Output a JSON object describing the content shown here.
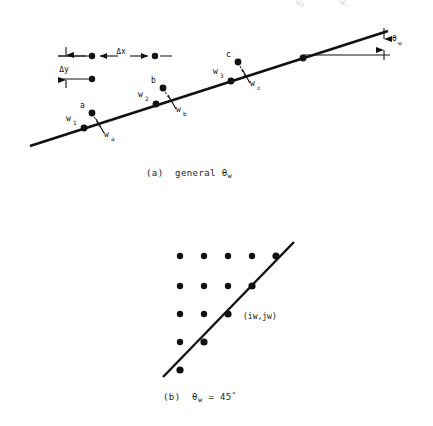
{
  "figure": {
    "background_color": "#ffffff",
    "ink_color": "#111111",
    "ghost_color": "#d8d8d8",
    "ghost_labels": [
      {
        "base": "w",
        "sub": "b"
      },
      {
        "base": "w",
        "sub": "c"
      }
    ],
    "panels": [
      {
        "id": "panel-a",
        "caption_prefix": "(a)",
        "caption_word": "general",
        "caption_symbol": "θ",
        "caption_symbol_sub": "w",
        "angle_label": {
          "base": "θ",
          "sub": "w"
        },
        "delta_x_label": "Δx",
        "delta_y_label": "Δy",
        "wall_line": {
          "x1": 30,
          "y1": 146,
          "x2": 388,
          "y2": 31
        },
        "horizontal_ref": {
          "x1": 303,
          "y1": 55,
          "x2": 390,
          "y2": 55
        },
        "wall_nodes": [
          {
            "name": "w1",
            "label_base": "w",
            "label_sub": "1",
            "x": 84,
            "y": 128,
            "label_x": 70,
            "label_y": 118
          },
          {
            "name": "w2",
            "label_base": "w",
            "label_sub": "2",
            "x": 156,
            "y": 104,
            "label_x": 141,
            "label_y": 94
          },
          {
            "name": "w3",
            "label_base": "w",
            "label_sub": "3",
            "x": 231,
            "y": 81,
            "label_x": 216,
            "label_y": 70
          },
          {
            "name": "w4",
            "label_base": "",
            "label_sub": "",
            "x": 303,
            "y": 58,
            "label_x": 0,
            "label_y": 0
          }
        ],
        "data_points": [
          {
            "name": "a",
            "label": "a",
            "x": 92,
            "y": 113,
            "label_x": 83,
            "label_y": 103,
            "foot_x": 100,
            "foot_y": 126,
            "foot_label_base": "w",
            "foot_label_sub": "a",
            "foot_label_x": 102,
            "foot_label_y": 130
          },
          {
            "name": "b",
            "label": "b",
            "x": 163,
            "y": 88,
            "label_x": 153,
            "label_y": 79,
            "foot_x": 172,
            "foot_y": 101,
            "foot_label_base": "w",
            "foot_label_sub": "b",
            "foot_label_x": 174,
            "foot_label_y": 105
          },
          {
            "name": "c",
            "label": "c",
            "x": 238,
            "y": 62,
            "label_x": 229,
            "label_y": 52,
            "foot_x": 246,
            "foot_y": 78,
            "foot_label_base": "w",
            "foot_label_sub": "c",
            "foot_label_x": 248,
            "foot_label_y": 82
          }
        ],
        "dimension_dots": [
          {
            "x": 92,
            "y": 56
          },
          {
            "x": 155,
            "y": 56
          },
          {
            "x": 92,
            "y": 79
          }
        ]
      },
      {
        "id": "panel-b",
        "caption_prefix": "(b)",
        "caption_symbol": "θ",
        "caption_symbol_sub": "w",
        "caption_equals": "=",
        "caption_value": "45",
        "caption_degree": "°",
        "point_label": "(iw,jw)",
        "point_label_x": 249,
        "point_label_y": 311,
        "grid_origin": {
          "x": 180,
          "y": 256
        },
        "grid_spacing": 24,
        "grid_dots": [
          {
            "col": 0,
            "row": 0
          },
          {
            "col": 1,
            "row": 0
          },
          {
            "col": 2,
            "row": 0
          },
          {
            "col": 3,
            "row": 0
          },
          {
            "col": 4,
            "row": 0
          },
          {
            "col": 0,
            "row": 1
          },
          {
            "col": 1,
            "row": 1
          },
          {
            "col": 2,
            "row": 1
          },
          {
            "col": 3,
            "row": 1
          },
          {
            "col": 0,
            "row": 2
          },
          {
            "col": 1,
            "row": 2
          },
          {
            "col": 2,
            "row": 2
          },
          {
            "col": 0,
            "row": 3
          },
          {
            "col": 1,
            "row": 3
          },
          {
            "col": 0,
            "row": 4
          }
        ],
        "line_dots": [
          {
            "col": 0,
            "row": 4
          },
          {
            "col": 1,
            "row": 3
          },
          {
            "col": 2,
            "row": 2
          },
          {
            "col": 3,
            "row": 1
          },
          {
            "col": 4,
            "row": 0
          }
        ],
        "highlight_dot": {
          "col": 2,
          "row": 2
        },
        "diagonal_line": {
          "x1": 163,
          "y1": 377,
          "x2": 294,
          "y2": 242
        }
      }
    ]
  }
}
